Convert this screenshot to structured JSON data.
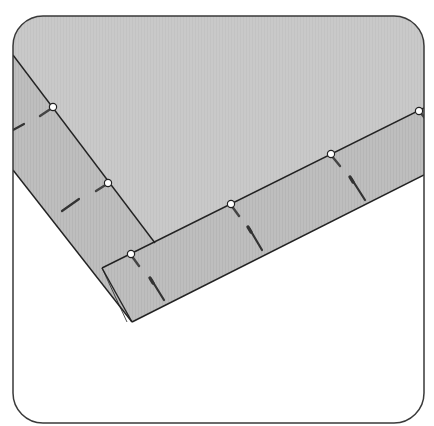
{
  "figure": {
    "title": "Pinned binding strip mitered corner",
    "colors": {
      "background": "#ffffff",
      "frame_stroke": "#3a3a3a",
      "fabric_main": "#c9c9c9",
      "fabric_strip": "#bdbdbd",
      "seam_line": "#222222",
      "pin_head": "#ffffff",
      "pin_shaft": "#555555"
    },
    "pins_on_seam": 5,
    "pins_in_strip": 5
  }
}
